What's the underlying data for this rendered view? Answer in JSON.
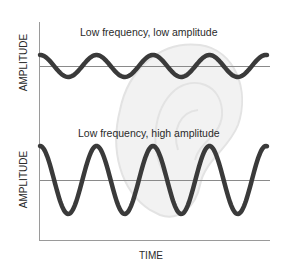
{
  "diagram": {
    "top_panel": {
      "title": "Low frequency, low amplitude",
      "y_label": "AMPLITUDE",
      "baseline_y": 66,
      "amplitude": 11
    },
    "bottom_panel": {
      "title": "Low frequency, high amplitude",
      "y_label": "AMPLITUDE",
      "baseline_y": 180,
      "amplitude": 34
    },
    "x_label": "TIME",
    "colors": {
      "wave": "#3a3a3a",
      "axis": "#9a9a9a",
      "baseline": "#8a8a8a",
      "background_ear": "#e6e6e6"
    }
  }
}
